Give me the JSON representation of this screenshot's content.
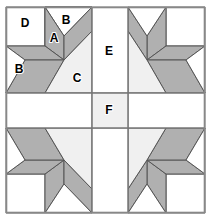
{
  "figure": {
    "kind": "quilt-block-diagram",
    "width": 213,
    "height": 221,
    "background": "#ffffff"
  },
  "colors": {
    "background": "#ffffff",
    "light_patch": "#f0f0f0",
    "white_patch": "#ffffff",
    "shaded_patch": "#b0b0b0",
    "piece_outline": "#555555",
    "grid_line": "#777777",
    "outer_border": "#888888",
    "label_text": "#000000"
  },
  "block": {
    "outer_border": {
      "x": 6,
      "y": 7,
      "width": 199,
      "height": 206
    },
    "grid": {
      "vertical_lines": [
        6,
        92,
        128,
        205
      ],
      "horizontal_lines": [
        7,
        93,
        128,
        213
      ],
      "column_widths": [
        86,
        36,
        77
      ],
      "row_heights": [
        86,
        35,
        85
      ]
    }
  },
  "labels": [
    {
      "id": "D",
      "text": "D",
      "x": 25,
      "y": 24,
      "piece": "corner-square"
    },
    {
      "id": "B_top",
      "text": "B",
      "x": 66,
      "y": 21,
      "piece": "background-triangle-top"
    },
    {
      "id": "A",
      "text": "A",
      "x": 54,
      "y": 39,
      "piece": "star-diamond"
    },
    {
      "id": "B_left",
      "text": "B",
      "x": 19,
      "y": 70,
      "piece": "background-triangle-left"
    },
    {
      "id": "C",
      "text": "C",
      "x": 77,
      "y": 79,
      "piece": "light-triangle"
    },
    {
      "id": "E",
      "text": "E",
      "x": 109,
      "y": 52,
      "piece": "vertical-sashing"
    },
    {
      "id": "F",
      "text": "F",
      "x": 109,
      "y": 111,
      "piece": "center-square"
    }
  ],
  "legend": {
    "piece_names": {
      "A": "star point diamond (shaded)",
      "B": "background triangle (white)",
      "C": "light corner triangle",
      "D": "corner square (white)",
      "E": "sashing rectangle (white)",
      "F": "center sashing square (light)"
    }
  },
  "quadrants": [
    {
      "id": "top-left",
      "transform": "none",
      "origin": [
        6,
        7
      ],
      "size": [
        86,
        86
      ]
    },
    {
      "id": "top-right",
      "transform": "mirror-x",
      "origin": [
        128,
        7
      ],
      "size": [
        77,
        86
      ]
    },
    {
      "id": "bottom-left",
      "transform": "mirror-y",
      "origin": [
        6,
        128
      ],
      "size": [
        86,
        85
      ]
    },
    {
      "id": "bottom-right",
      "transform": "rotate-180",
      "origin": [
        128,
        128
      ],
      "size": [
        77,
        85
      ]
    }
  ]
}
